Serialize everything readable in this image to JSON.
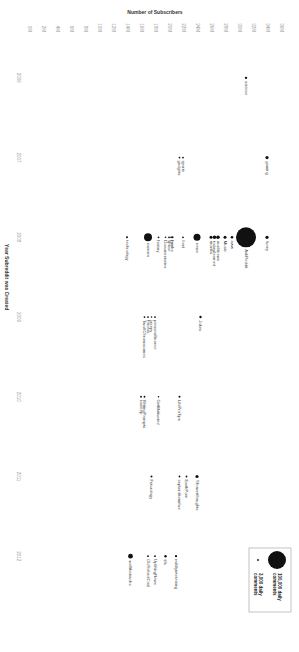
{
  "chart_data": {
    "type": "scatter",
    "title": "",
    "xlabel": "Year Subreddit was Created",
    "ylabel": "Number of Subscribers",
    "x_ticks": [
      "2006",
      "2007",
      "2008",
      "2009",
      "2010",
      "2011",
      "2012"
    ],
    "y_ticks": [
      "0M",
      "2M",
      "4M",
      "6M",
      "8M",
      "10M",
      "12M",
      "14M",
      "16M",
      "18M",
      "20M",
      "22M",
      "24M",
      "26M",
      "28M",
      "30M",
      "32M",
      "34M",
      "36M"
    ],
    "xlim": [
      2005.5,
      2012.8
    ],
    "ylim": [
      0,
      36
    ],
    "grid": false,
    "bubble_size_encodes": "daily comments",
    "legend": {
      "position": "top-right",
      "entries": [
        {
          "label": "100,000 daily comments",
          "size": "large"
        },
        {
          "label": "3,000 daily comments",
          "size": "small"
        }
      ]
    },
    "points": [
      {
        "name": "science",
        "year": 2006,
        "subscribers_m": 31,
        "size": 1.2
      },
      {
        "name": "gaming",
        "year": 2007,
        "subscribers_m": 34,
        "size": 1.6
      },
      {
        "name": "sports",
        "year": 2007,
        "subscribers_m": 22,
        "size": 0.9
      },
      {
        "name": "gadgets",
        "year": 2007,
        "subscribers_m": 21.5,
        "size": 0.9
      },
      {
        "name": "funny",
        "year": 2008,
        "subscribers_m": 34,
        "size": 1.6
      },
      {
        "name": "AskReddit",
        "year": 2008,
        "subscribers_m": 31,
        "size": 10
      },
      {
        "name": "aww",
        "year": 2008,
        "subscribers_m": 29,
        "size": 1.3
      },
      {
        "name": "Music",
        "year": 2008,
        "subscribers_m": 28,
        "size": 1.5
      },
      {
        "name": "worldnews",
        "year": 2008,
        "subscribers_m": 27,
        "size": 1.8
      },
      {
        "name": "todayilearned",
        "year": 2008,
        "subscribers_m": 26.5,
        "size": 1.8
      },
      {
        "name": "movies",
        "year": 2008,
        "subscribers_m": 26,
        "size": 1.5
      },
      {
        "name": "news",
        "year": 2008,
        "subscribers_m": 24,
        "size": 3.5
      },
      {
        "name": "food",
        "year": 2008,
        "subscribers_m": 22,
        "size": 0.9
      },
      {
        "name": "books",
        "year": 2008,
        "subscribers_m": 20.5,
        "size": 1.0
      },
      {
        "name": "DIY",
        "year": 2008,
        "subscribers_m": 20.3,
        "size": 0.9
      },
      {
        "name": "space",
        "year": 2008,
        "subscribers_m": 20,
        "size": 0.9
      },
      {
        "name": "Documentaries",
        "year": 2008,
        "subscribers_m": 19.5,
        "size": 0.8
      },
      {
        "name": "history",
        "year": 2008,
        "subscribers_m": 18.5,
        "size": 0.9
      },
      {
        "name": "memes",
        "year": 2008,
        "subscribers_m": 17,
        "size": 4
      },
      {
        "name": "technology",
        "year": 2008,
        "subscribers_m": 14,
        "size": 1.0
      },
      {
        "name": "Jokes",
        "year": 2009,
        "subscribers_m": 24.5,
        "size": 1.2
      },
      {
        "name": "Fitness",
        "year": 2009,
        "subscribers_m": 17,
        "size": 0.9
      },
      {
        "name": "personalfinance",
        "year": 2009,
        "subscribers_m": 18,
        "size": 0.9
      },
      {
        "name": "creepy",
        "year": 2009,
        "subscribers_m": 17.5,
        "size": 0.8
      },
      {
        "name": "TwoXChromosomes",
        "year": 2009,
        "subscribers_m": 16.5,
        "size": 0.9
      },
      {
        "name": "LifeProTips",
        "year": 2010,
        "subscribers_m": 21.5,
        "size": 1.0
      },
      {
        "name": "GetMotivated",
        "year": 2010,
        "subscribers_m": 18.5,
        "size": 0.8
      },
      {
        "name": "WritingPrompts",
        "year": 2010,
        "subscribers_m": 16.5,
        "size": 0.9
      },
      {
        "name": "nosleep",
        "year": 2010,
        "subscribers_m": 16,
        "size": 0.9
      },
      {
        "name": "Showerthoughts",
        "year": 2011,
        "subscribers_m": 24,
        "size": 1.6
      },
      {
        "name": "EarthPorn",
        "year": 2011,
        "subscribers_m": 22.5,
        "size": 0.9
      },
      {
        "name": "explainlikeimfive",
        "year": 2011,
        "subscribers_m": 21.5,
        "size": 0.9
      },
      {
        "name": "Futurology",
        "year": 2011,
        "subscribers_m": 17.5,
        "size": 1.0
      },
      {
        "name": "mildlyinteresting",
        "year": 2012,
        "subscribers_m": 21,
        "size": 1.1
      },
      {
        "name": "tifu",
        "year": 2012,
        "subscribers_m": 19.5,
        "size": 1.2
      },
      {
        "name": "UpliftingNews",
        "year": 2012,
        "subscribers_m": 18,
        "size": 0.9
      },
      {
        "name": "OldSchoolCool",
        "year": 2012,
        "subscribers_m": 17,
        "size": 0.9
      },
      {
        "name": "wellthatsucks",
        "year": 2012,
        "subscribers_m": 14.5,
        "size": 2.4
      }
    ]
  },
  "colors": {
    "bubble": "#111111",
    "tick_text": "#9a9a9a",
    "label_text": "#444444",
    "legend_border": "#999999"
  },
  "orientation": "rotated 90 degrees clockwise"
}
